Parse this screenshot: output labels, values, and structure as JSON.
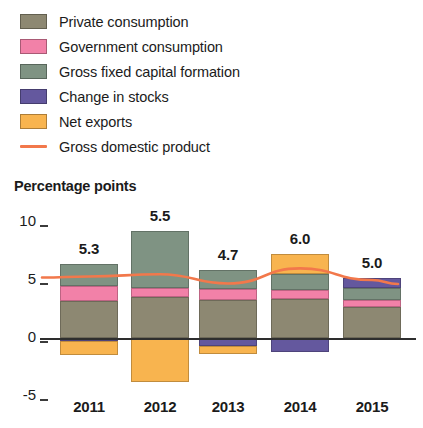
{
  "legend": {
    "items": [
      {
        "label": "Private consumption",
        "color": "#8d8872",
        "marker": "box",
        "key": "private"
      },
      {
        "label": "Government consumption",
        "color": "#f281a8",
        "marker": "box",
        "key": "government"
      },
      {
        "label": "Gross fixed capital formation",
        "color": "#7f9383",
        "marker": "box",
        "key": "gfcf"
      },
      {
        "label": "Change in stocks",
        "color": "#64589e",
        "marker": "box",
        "key": "stocks"
      },
      {
        "label": "Net exports",
        "color": "#f8b košt",
        "marker": "box",
        "key": "net_exports"
      },
      {
        "label": "Gross domestic product",
        "color": "#f2784b",
        "marker": "line",
        "key": "gdp"
      }
    ]
  },
  "chart_data": {
    "type": "bar",
    "title": "",
    "ylabel": "Percentage points",
    "xlabel": "",
    "categories": [
      "2011",
      "2012",
      "2013",
      "2014",
      "2015"
    ],
    "ylim": [
      -5,
      10
    ],
    "yticks": [
      10,
      5,
      0,
      -5
    ],
    "ytick_labels": [
      "10",
      "5",
      "0",
      "-5"
    ],
    "grid": false,
    "stacked": true,
    "legend_position": "top",
    "series": [
      {
        "name": "Private consumption",
        "color": "#8d8872",
        "values": [
          3.2,
          3.5,
          3.3,
          3.4,
          2.7
        ]
      },
      {
        "name": "Government consumption",
        "color": "#f281a8",
        "values": [
          1.3,
          0.8,
          0.9,
          0.7,
          0.6
        ]
      },
      {
        "name": "Gross fixed capital formation",
        "color": "#7f9383",
        "values": [
          1.9,
          4.9,
          1.7,
          1.4,
          1.0
        ]
      },
      {
        "name": "Change in stocks",
        "color": "#64589e",
        "values": [
          -0.3,
          0.0,
          -0.7,
          -1.2,
          0.9
        ]
      },
      {
        "name": "Net exports",
        "color": "#f8b44f",
        "values": [
          -1.2,
          -3.8,
          -0.7,
          1.7,
          -0.2
        ]
      }
    ],
    "line_series": {
      "name": "Gross domestic product",
      "color": "#f2784b",
      "values": [
        5.3,
        5.5,
        4.7,
        6.0,
        5.0
      ]
    },
    "bar_labels": [
      "5.3",
      "5.5",
      "4.7",
      "6.0",
      "5.0"
    ]
  }
}
